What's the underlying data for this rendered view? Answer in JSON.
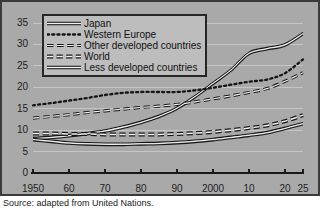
{
  "chart_data": {
    "type": "line",
    "title": "",
    "xlabel": "",
    "ylabel": "",
    "xlim": [
      1950,
      2025
    ],
    "ylim": [
      0,
      35
    ],
    "grid": true,
    "legend_position": "top-left",
    "xticks": [
      1950,
      1960,
      1970,
      1980,
      1990,
      2000,
      2010,
      2020,
      2025
    ],
    "xtick_labels": [
      "1950",
      "60",
      "70",
      "80",
      "90",
      "2000",
      "10",
      "20",
      "25"
    ],
    "yticks": [
      0,
      5,
      10,
      15,
      20,
      25,
      30,
      35
    ],
    "ytick_labels": [
      "0",
      "5",
      "10",
      "15",
      "20",
      "25",
      "30",
      "35"
    ],
    "x": [
      1950,
      1955,
      1960,
      1965,
      1970,
      1975,
      1980,
      1985,
      1990,
      1995,
      2000,
      2005,
      2010,
      2015,
      2020,
      2025
    ],
    "series": [
      {
        "name": "Japan",
        "style": "solid",
        "values": [
          8.0,
          8.3,
          8.7,
          9.2,
          9.8,
          10.7,
          11.8,
          13.2,
          15.1,
          17.8,
          20.9,
          24.0,
          27.9,
          29.0,
          29.9,
          32.5
        ]
      },
      {
        "name": "Western Europe",
        "style": "dotted",
        "values": [
          15.8,
          16.3,
          16.9,
          17.5,
          18.2,
          18.7,
          18.9,
          18.9,
          18.9,
          19.3,
          19.9,
          20.6,
          21.3,
          21.8,
          23.3,
          26.5
        ]
      },
      {
        "name": "Other developed countries",
        "style": "dashed-thin",
        "values": [
          12.8,
          13.2,
          13.6,
          14.1,
          14.5,
          14.9,
          15.3,
          15.6,
          16.0,
          16.6,
          17.3,
          18.0,
          18.8,
          19.7,
          21.4,
          23.4
        ]
      },
      {
        "name": "World",
        "style": "dashed-thick",
        "values": [
          9.2,
          9.2,
          9.1,
          9.1,
          9.0,
          9.0,
          9.0,
          9.0,
          9.1,
          9.3,
          9.6,
          10.0,
          10.5,
          11.1,
          12.1,
          13.5
        ]
      },
      {
        "name": "Less developed countries",
        "style": "solid",
        "values": [
          7.8,
          7.4,
          7.0,
          6.8,
          6.7,
          6.7,
          6.8,
          6.9,
          7.1,
          7.4,
          7.8,
          8.3,
          8.8,
          9.4,
          10.4,
          11.5
        ]
      }
    ]
  },
  "legend": {
    "items": [
      {
        "label": "Japan",
        "style": "solid"
      },
      {
        "label": "Western Europe",
        "style": "dotted"
      },
      {
        "label": "Other developed countries",
        "style": "dashed-thin"
      },
      {
        "label": "World",
        "style": "dashed-thick"
      },
      {
        "label": "Less developed countries",
        "style": "solid"
      }
    ]
  },
  "source": {
    "text": "Source:  adapted from United Nations."
  },
  "colors": {
    "panel_background": "#a9a9a9",
    "panel_border": "#3a3a3a",
    "axis": "#1a1a1a",
    "line_dark": "#161616",
    "line_highlight": "#f2f2f2",
    "legend_background": "#bdbdbd",
    "text": "#1a1a1a"
  }
}
